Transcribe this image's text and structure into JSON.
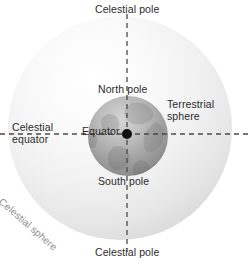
{
  "diagram": {
    "background_color": "#ffffff",
    "text_color": "#2b2b2b",
    "light_text_color": "#8e8e8e",
    "axis_color": "#4a4a4a"
  },
  "labels": {
    "celestial_pole_top": "Celestial pole",
    "celestial_pole_bottom": "Celestial pole",
    "celestial_equator_line1": "Celestial",
    "celestial_equator_line2": "equator",
    "terrestrial_sphere_line1": "Terrestrial",
    "terrestrial_sphere_line2": "sphere",
    "north_pole": "North pole",
    "south_pole": "South pole",
    "equator": "Equator",
    "celestial_sphere": "Celestial sphere"
  },
  "geometry": {
    "celestial_sphere": {
      "center_x": 120,
      "center_y": 128,
      "radius": 112,
      "fill_light": "#fcfcfc",
      "fill_dark": "#d8d8d8"
    },
    "terrestrial_sphere": {
      "center_x": 128,
      "center_y": 136,
      "radius": 40,
      "fill_light": "#cfcfcf",
      "fill_dark": "#8a8a8a"
    },
    "polar_axis": {
      "x": 127,
      "y_start": 14,
      "y_end": 252
    },
    "equatorial_axis": {
      "y": 134,
      "x_start": 0,
      "x_end": 249
    },
    "center_point": {
      "x": 127,
      "y": 134,
      "radius": 5,
      "color": "#111111"
    },
    "dash_pattern": "5,4"
  }
}
